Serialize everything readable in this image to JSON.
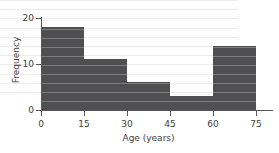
{
  "chart_data": {
    "type": "bar",
    "title": "",
    "subtitle": "",
    "xlabel": "Age (years)",
    "ylabel": "Frequency",
    "categories": [
      "0-15",
      "15-30",
      "30-45",
      "45-60",
      "60-75"
    ],
    "bin_edges": [
      0,
      15,
      30,
      45,
      60,
      75
    ],
    "values": [
      18,
      11,
      6,
      3,
      14
    ],
    "xlim": [
      0,
      75
    ],
    "ylim": [
      0,
      20
    ],
    "x_ticks": [
      "0",
      "15",
      "30",
      "45",
      "60",
      "75"
    ],
    "y_ticks": [
      "0",
      "10",
      "20"
    ],
    "grid": true,
    "grid_axis": "y",
    "grid_step": 2,
    "legend": null,
    "legend_position": "none",
    "annotations": [],
    "bar_color": "#4f4f52",
    "grid_color": "#eceded",
    "axis_color": "#58585b",
    "text_color": "#404040",
    "background_color": "#ffffff"
  }
}
